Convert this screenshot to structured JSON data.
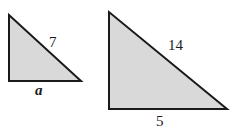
{
  "diagram": {
    "fill_color": "#d9d9d9",
    "stroke_color": "#1a1a1a",
    "small_triangle": {
      "hypotenuse_label": "7",
      "base_label": "a"
    },
    "large_triangle": {
      "hypotenuse_label": "14",
      "base_label": "5"
    }
  }
}
